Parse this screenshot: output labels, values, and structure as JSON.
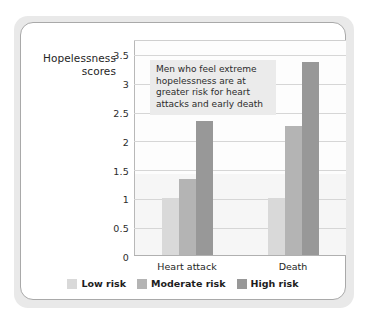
{
  "chart_data": {
    "type": "bar",
    "title": "",
    "subtitle": "",
    "xlabel": "",
    "ylabel": "Hopelessness scores",
    "ylabel_lines": [
      "Hopelessness",
      "scores"
    ],
    "categories": [
      "Heart attack",
      "Death"
    ],
    "series": [
      {
        "name": "Low risk",
        "values": [
          1.0,
          1.0
        ],
        "color": "#d9d9d9"
      },
      {
        "name": "Moderate risk",
        "values": [
          1.33,
          2.25
        ],
        "color": "#b4b4b4"
      },
      {
        "name": "High risk",
        "values": [
          2.35,
          3.37
        ],
        "color": "#989898"
      }
    ],
    "ylim": [
      0,
      3.75
    ],
    "yticks": [
      "0",
      "0.5",
      "1",
      "1.5",
      "2",
      "2.5",
      "3",
      "3.5"
    ],
    "ytick_values": [
      0,
      0.5,
      1,
      1.5,
      2,
      2.5,
      3,
      3.5
    ],
    "grid": true,
    "legend_position": "bottom",
    "annotations": [
      {
        "text": "Men who feel extreme hopelessness are at greater risk for heart attacks and early death",
        "lines": [
          "Men who feel extreme",
          "hopelessness are at",
          "greater risk for heart",
          "attacks and early death"
        ],
        "background": "#ebebeb"
      }
    ],
    "plot_background": "#fdfdfd",
    "gridline_color": "#d6d6d6"
  }
}
